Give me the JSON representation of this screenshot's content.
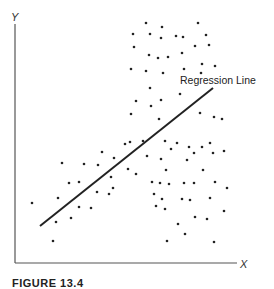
{
  "chart_data": {
    "type": "scatter",
    "title": "",
    "xlabel": "X",
    "ylabel": "Y",
    "grid": false,
    "legend": null,
    "annotations": [
      {
        "text": "Regression Line",
        "x": 180,
        "y": 84
      }
    ],
    "regression_line": {
      "x1": 40,
      "y1": 226,
      "x2": 213,
      "y2": 88
    },
    "points_pixel_coords": [
      [
        146,
        23
      ],
      [
        162,
        27
      ],
      [
        198,
        23
      ],
      [
        133,
        34
      ],
      [
        150,
        34
      ],
      [
        161,
        38
      ],
      [
        176,
        36
      ],
      [
        183,
        37
      ],
      [
        206,
        35
      ],
      [
        134,
        47
      ],
      [
        195,
        46
      ],
      [
        209,
        45
      ],
      [
        149,
        55
      ],
      [
        158,
        58
      ],
      [
        168,
        57
      ],
      [
        182,
        53
      ],
      [
        131,
        69
      ],
      [
        146,
        71
      ],
      [
        163,
        73
      ],
      [
        184,
        69
      ],
      [
        202,
        64
      ],
      [
        215,
        66
      ],
      [
        201,
        73
      ],
      [
        150,
        88
      ],
      [
        180,
        94
      ],
      [
        136,
        101
      ],
      [
        151,
        106
      ],
      [
        161,
        100
      ],
      [
        131,
        114
      ],
      [
        159,
        119
      ],
      [
        200,
        113
      ],
      [
        214,
        117
      ],
      [
        222,
        119
      ],
      [
        125,
        144
      ],
      [
        143,
        141
      ],
      [
        177,
        143
      ],
      [
        189,
        147
      ],
      [
        202,
        147
      ],
      [
        210,
        143
      ],
      [
        130,
        142
      ],
      [
        102,
        152
      ],
      [
        114,
        158
      ],
      [
        62,
        163
      ],
      [
        84,
        164
      ],
      [
        98,
        165
      ],
      [
        128,
        169
      ],
      [
        136,
        174
      ],
      [
        111,
        177
      ],
      [
        69,
        183
      ],
      [
        79,
        182
      ],
      [
        113,
        188
      ],
      [
        97,
        192
      ],
      [
        109,
        194
      ],
      [
        32,
        203
      ],
      [
        58,
        198
      ],
      [
        79,
        207
      ],
      [
        91,
        208
      ],
      [
        56,
        222
      ],
      [
        71,
        218
      ],
      [
        53,
        241
      ],
      [
        165,
        141
      ],
      [
        171,
        149
      ],
      [
        147,
        156
      ],
      [
        161,
        159
      ],
      [
        187,
        160
      ],
      [
        194,
        153
      ],
      [
        213,
        153
      ],
      [
        224,
        151
      ],
      [
        166,
        170
      ],
      [
        203,
        170
      ],
      [
        152,
        182
      ],
      [
        160,
        183
      ],
      [
        169,
        184
      ],
      [
        184,
        183
      ],
      [
        194,
        183
      ],
      [
        215,
        182
      ],
      [
        227,
        188
      ],
      [
        154,
        194
      ],
      [
        162,
        199
      ],
      [
        182,
        199
      ],
      [
        190,
        200
      ],
      [
        210,
        198
      ],
      [
        156,
        206
      ],
      [
        165,
        209
      ],
      [
        224,
        211
      ],
      [
        195,
        217
      ],
      [
        207,
        219
      ],
      [
        178,
        224
      ],
      [
        185,
        234
      ],
      [
        167,
        241
      ],
      [
        214,
        242
      ]
    ],
    "axes": {
      "origin": [
        15,
        263
      ],
      "y_top": 24,
      "x_right": 237
    }
  },
  "labels": {
    "y_axis": "Y",
    "x_axis": "X",
    "regression": "Regression Line",
    "caption": "FIGURE 13.4"
  },
  "colors": {
    "axis": "#555555",
    "point": "#222222",
    "line": "#222222"
  }
}
